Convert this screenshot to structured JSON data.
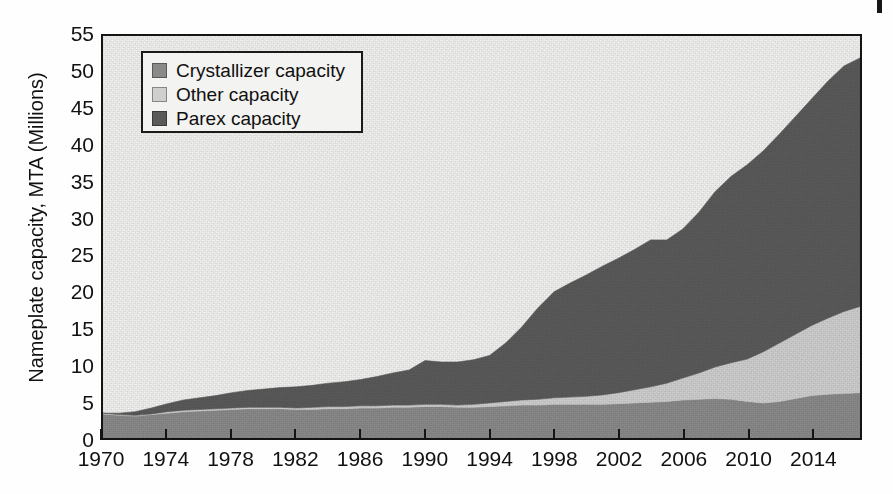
{
  "chart_data": {
    "type": "area",
    "stacked": true,
    "title": "",
    "xlabel": "",
    "ylabel": "Nameplate capacity, MTA (Millions)",
    "xlim": [
      1970,
      2017
    ],
    "ylim": [
      0,
      55
    ],
    "ytick_step": 5,
    "xtick_step": 4,
    "grid": false,
    "legend_position": "top-left",
    "yticks": [
      "0",
      "5",
      "10",
      "15",
      "20",
      "25",
      "30",
      "35",
      "40",
      "45",
      "50",
      "55"
    ],
    "xticks": [
      "1970",
      "1974",
      "1978",
      "1982",
      "1986",
      "1990",
      "1994",
      "1998",
      "2002",
      "2006",
      "2010",
      "2014"
    ],
    "x": [
      1970,
      1971,
      1972,
      1973,
      1974,
      1975,
      1976,
      1977,
      1978,
      1979,
      1980,
      1981,
      1982,
      1983,
      1984,
      1985,
      1986,
      1987,
      1988,
      1989,
      1990,
      1991,
      1992,
      1993,
      1994,
      1995,
      1996,
      1997,
      1998,
      1999,
      2000,
      2001,
      2002,
      2003,
      2004,
      2005,
      2006,
      2007,
      2008,
      2009,
      2010,
      2011,
      2012,
      2013,
      2014,
      2015,
      2016,
      2017
    ],
    "series": [
      {
        "name": "Crystallizer capacity",
        "color": "#8a8a8a",
        "order": 1,
        "values": [
          3.3,
          3.1,
          3.0,
          3.2,
          3.4,
          3.6,
          3.7,
          3.8,
          3.9,
          4.0,
          4.0,
          4.0,
          3.9,
          3.9,
          4.0,
          4.0,
          4.1,
          4.1,
          4.2,
          4.2,
          4.3,
          4.3,
          4.2,
          4.2,
          4.3,
          4.4,
          4.5,
          4.5,
          4.6,
          4.6,
          4.6,
          4.6,
          4.7,
          4.8,
          4.9,
          5.0,
          5.2,
          5.3,
          5.4,
          5.3,
          5.0,
          4.8,
          5.0,
          5.4,
          5.8,
          6.0,
          6.1,
          6.2
        ]
      },
      {
        "name": "Other capacity",
        "color": "#cfcfcf",
        "order": 2,
        "values": [
          0.1,
          0.1,
          0.1,
          0.1,
          0.2,
          0.2,
          0.2,
          0.2,
          0.2,
          0.2,
          0.2,
          0.2,
          0.2,
          0.3,
          0.3,
          0.3,
          0.3,
          0.3,
          0.3,
          0.3,
          0.3,
          0.3,
          0.3,
          0.4,
          0.5,
          0.6,
          0.7,
          0.8,
          0.9,
          1.0,
          1.1,
          1.3,
          1.5,
          1.8,
          2.1,
          2.5,
          3.0,
          3.6,
          4.3,
          5.0,
          5.8,
          7.0,
          8.0,
          8.8,
          9.6,
          10.4,
          11.2,
          11.8
        ]
      },
      {
        "name": "Parex capacity",
        "color": "#5a5a5a",
        "order": 3,
        "values": [
          0.0,
          0.2,
          0.5,
          0.8,
          1.1,
          1.4,
          1.6,
          1.8,
          2.1,
          2.3,
          2.5,
          2.7,
          2.9,
          3.0,
          3.2,
          3.4,
          3.6,
          4.0,
          4.4,
          4.8,
          6.0,
          5.8,
          5.9,
          6.1,
          6.5,
          8.0,
          10.0,
          12.5,
          14.5,
          15.6,
          16.6,
          17.6,
          18.4,
          19.2,
          20.1,
          19.6,
          20.4,
          22.0,
          24.0,
          25.5,
          26.6,
          27.5,
          28.6,
          29.8,
          31.0,
          32.4,
          33.6,
          34.0
        ]
      }
    ],
    "totals": [
      3.4,
      3.4,
      3.6,
      4.1,
      4.7,
      5.2,
      5.5,
      5.8,
      6.2,
      6.5,
      6.7,
      6.9,
      7.0,
      7.2,
      7.5,
      7.7,
      8.0,
      8.4,
      8.9,
      9.3,
      10.6,
      10.4,
      10.4,
      10.7,
      11.3,
      13.0,
      15.2,
      17.8,
      20.0,
      21.2,
      22.3,
      23.5,
      24.6,
      25.8,
      27.1,
      27.1,
      28.6,
      30.9,
      33.7,
      35.8,
      37.4,
      39.3,
      41.6,
      44.0,
      46.4,
      48.8,
      50.9,
      52.0
    ]
  },
  "legend": {
    "items": [
      {
        "label": "Crystallizer capacity",
        "color": "#8a8a8a"
      },
      {
        "label": "Other capacity",
        "color": "#cfcfcf"
      },
      {
        "label": "Parex capacity",
        "color": "#5a5a5a"
      }
    ]
  },
  "axes": {
    "y_title": "Nameplate capacity, MTA (Millions)"
  }
}
